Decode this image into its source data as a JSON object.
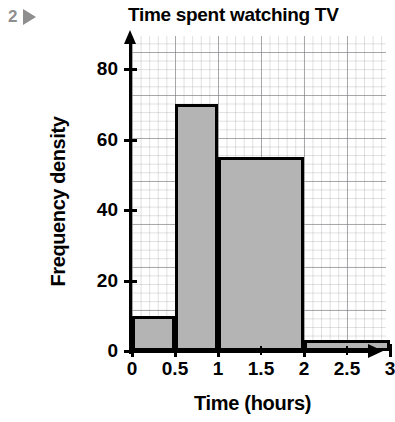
{
  "marker": {
    "number": "2",
    "icon": "play-triangle-icon"
  },
  "chart_data": {
    "type": "bar",
    "title": "Time spent watching TV",
    "xlabel": "Time (hours)",
    "ylabel": "Frequency density",
    "grid": true,
    "legend": "none",
    "xlim": [
      0,
      3
    ],
    "ylim": [
      0,
      88
    ],
    "x_ticks": [
      "0",
      "0.5",
      "1",
      "1.5",
      "2",
      "2.5",
      "3"
    ],
    "x_tick_values": [
      0,
      0.5,
      1,
      1.5,
      2,
      2.5,
      3
    ],
    "y_ticks": [
      "0",
      "20",
      "40",
      "60",
      "80"
    ],
    "y_tick_values": [
      0,
      20,
      40,
      60,
      80
    ],
    "bins": [
      {
        "label": "0 to 0.5",
        "x0": 0,
        "x1": 0.5,
        "value": 10
      },
      {
        "label": "0.5 to 1",
        "x0": 0.5,
        "x1": 1,
        "value": 70
      },
      {
        "label": "1 to 2",
        "x0": 1,
        "x1": 2,
        "value": 55
      },
      {
        "label": "2 to 3",
        "x0": 2,
        "x1": 3,
        "value": 3
      }
    ],
    "categories": [
      "0 to 0.5",
      "0.5 to 1",
      "1 to 2",
      "2 to 3"
    ],
    "values": [
      10,
      70,
      55,
      3
    ],
    "bar_fill_color": "#b4b4b4",
    "bar_border_color": "#000000",
    "grid_color": "#9a9a9f"
  }
}
